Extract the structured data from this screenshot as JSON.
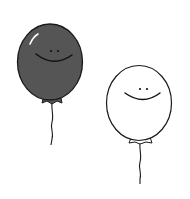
{
  "scene": {
    "background": "#ffffff",
    "balloons": [
      {
        "name": "dark-balloon",
        "fill": "#555555",
        "stroke": "#1a1a1a",
        "face": "smiley"
      },
      {
        "name": "white-balloon",
        "fill": "#ffffff",
        "stroke": "#1a1a1a",
        "face": "smiley"
      }
    ]
  }
}
